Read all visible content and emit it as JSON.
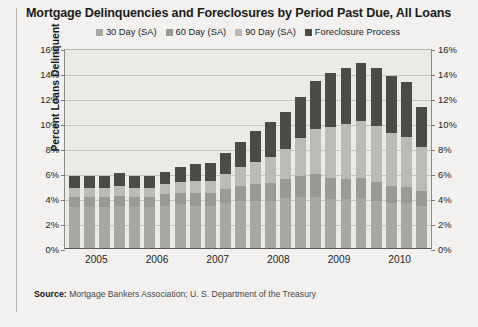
{
  "chart_data": {
    "type": "bar",
    "stacked": true,
    "title": "Mortgage Delinquencies and Foreclosures by Period Past Due, All Loans",
    "xlabel": "",
    "ylabel": "Percent Loans Delinquent",
    "ylim": [
      0,
      16
    ],
    "ytick_labels": [
      "16%",
      "14%",
      "12%",
      "10%",
      "8%",
      "6%",
      "4%",
      "2%",
      "0%"
    ],
    "ytick_values": [
      16,
      14,
      12,
      10,
      8,
      6,
      4,
      2,
      0
    ],
    "right_axis": true,
    "right_ytick_labels": [
      "16%",
      "14%",
      "12%",
      "10%",
      "8%",
      "6%",
      "4%",
      "2%",
      "0%"
    ],
    "grid": true,
    "legend_position": "top-center",
    "categories": [
      "2005 Q1",
      "2005 Q2",
      "2005 Q3",
      "2005 Q4",
      "2006 Q1",
      "2006 Q2",
      "2006 Q3",
      "2006 Q4",
      "2007 Q1",
      "2007 Q2",
      "2007 Q3",
      "2007 Q4",
      "2008 Q1",
      "2008 Q2",
      "2008 Q3",
      "2008 Q4",
      "2009 Q1",
      "2009 Q2",
      "2009 Q3",
      "2009 Q4",
      "2010 Q1",
      "2010 Q2",
      "2010 Q3",
      "2010 Q4"
    ],
    "xtick_labels": [
      "2005",
      "2006",
      "2007",
      "2008",
      "2009",
      "2010"
    ],
    "series": [
      {
        "name": "30 Day (SA)",
        "color": "#a9a7a3",
        "values": [
          3.3,
          3.3,
          3.3,
          3.4,
          3.3,
          3.3,
          3.4,
          3.5,
          3.4,
          3.4,
          3.6,
          3.8,
          3.8,
          3.8,
          4.0,
          4.1,
          4.1,
          3.9,
          3.9,
          4.0,
          3.8,
          3.6,
          3.6,
          3.4
        ],
        "axis_label": "30 Day (SA)"
      },
      {
        "name": "60 Day (SA)",
        "color": "#9b9995",
        "values": [
          0.8,
          0.8,
          0.8,
          0.8,
          0.8,
          0.8,
          0.9,
          0.9,
          1.0,
          1.0,
          1.1,
          1.2,
          1.3,
          1.4,
          1.5,
          1.7,
          1.8,
          1.7,
          1.6,
          1.6,
          1.5,
          1.4,
          1.3,
          1.2
        ],
        "axis_label": "60 Day (SA)"
      },
      {
        "name": "90 Day (SA)",
        "color": "#bcbab6",
        "values": [
          0.7,
          0.7,
          0.7,
          0.8,
          0.7,
          0.7,
          0.8,
          0.9,
          1.0,
          1.0,
          1.2,
          1.5,
          1.8,
          2.1,
          2.4,
          3.0,
          3.6,
          4.1,
          4.4,
          4.6,
          4.5,
          4.2,
          4.0,
          3.5
        ],
        "axis_label": "90 Day (SA)"
      },
      {
        "name": "Foreclosure Process",
        "color": "#4c4a48",
        "values": [
          1.0,
          1.0,
          1.0,
          1.0,
          1.0,
          1.0,
          1.0,
          1.2,
          1.3,
          1.4,
          1.7,
          2.0,
          2.5,
          2.8,
          3.0,
          3.3,
          3.9,
          4.3,
          4.5,
          4.6,
          4.6,
          4.6,
          4.4,
          3.2
        ],
        "axis_label": "Foreclosure Process"
      }
    ],
    "totals": [
      5.8,
      5.8,
      5.8,
      6.0,
      5.8,
      5.8,
      6.1,
      6.5,
      6.7,
      6.8,
      7.6,
      8.5,
      9.4,
      10.1,
      10.9,
      12.1,
      13.4,
      14.0,
      14.4,
      14.8,
      14.4,
      13.8,
      13.3,
      11.3
    ]
  },
  "source": {
    "label": "Source:",
    "text": " Mortgage Bankers Association; U. S. Department of the Treasury"
  }
}
